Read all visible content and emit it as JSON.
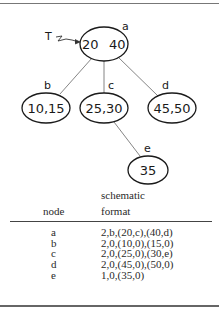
{
  "diagram": {
    "pointer_label": "T",
    "nodes": {
      "a": {
        "label": "a",
        "keys_left": "20",
        "keys_right": "40"
      },
      "b": {
        "label": "b",
        "keys": "10,15"
      },
      "c": {
        "label": "c",
        "keys": "25,30"
      },
      "d": {
        "label": "d",
        "keys": "45,50"
      },
      "e": {
        "label": "e",
        "keys": "35"
      }
    },
    "edges": [
      {
        "from": "a",
        "to": "b"
      },
      {
        "from": "a",
        "to": "c"
      },
      {
        "from": "a",
        "to": "d"
      },
      {
        "from": "c",
        "to": "e"
      }
    ]
  },
  "table": {
    "header_node": "node",
    "header_format_line1": "schematic",
    "header_format_line2": "format",
    "rows": [
      {
        "node": "a",
        "format": "2,b,(20,c),(40,d)"
      },
      {
        "node": "b",
        "format": "2,0,(10,0),(15,0)"
      },
      {
        "node": "c",
        "format": "2,0,(25,0),(30,e)"
      },
      {
        "node": "d",
        "format": "2,0,(45,0),(50,0)"
      },
      {
        "node": "e",
        "format": "1,0,(35,0)"
      }
    ]
  },
  "colors": {
    "ink": "#1a1a1a",
    "rule": "#555555",
    "background": "#ffffff"
  }
}
